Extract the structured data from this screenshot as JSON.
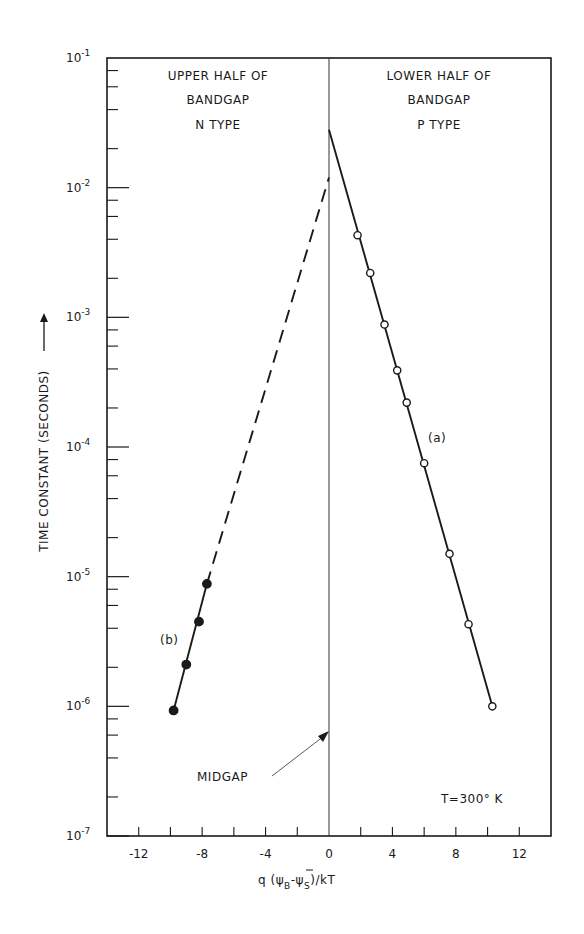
{
  "chart_data": {
    "type": "line",
    "title": "",
    "xlabel": "q (ψB − ψ̄S)/kT",
    "xlabel_parts": {
      "main": "q (ψ",
      "sub1": "B",
      "mid": "-ψ̄",
      "sub2": "S",
      "tail": ")/kT"
    },
    "ylabel": "TIME CONSTANT (SECONDS) ⟶",
    "yscale": "log",
    "xlim": [
      -14,
      14
    ],
    "ylim": [
      1e-07,
      0.1
    ],
    "grid": false,
    "x_ticks": [
      -12,
      -8,
      -4,
      0,
      4,
      8,
      12
    ],
    "x_tick_labels": [
      "-12",
      "-8",
      "-4",
      "0",
      "4",
      "8",
      "12"
    ],
    "y_ticks": [
      0.1,
      0.01,
      0.001,
      0.0001,
      1e-05,
      1e-06,
      1e-07
    ],
    "y_tick_labels": [
      {
        "base": "10",
        "exp": "-1"
      },
      {
        "base": "10",
        "exp": "-2"
      },
      {
        "base": "10",
        "exp": "-3"
      },
      {
        "base": "10",
        "exp": "-4"
      },
      {
        "base": "10",
        "exp": "-5"
      },
      {
        "base": "10",
        "exp": "-6"
      },
      {
        "base": "10",
        "exp": "-7"
      }
    ],
    "series": [
      {
        "name": "(a)",
        "marker": "open-circle",
        "line": "solid",
        "x": [
          1.8,
          2.6,
          3.5,
          4.3,
          4.9,
          6.0,
          7.6,
          8.8,
          10.3
        ],
        "y": [
          0.0043,
          0.0022,
          0.00088,
          0.00039,
          0.00022,
          7.5e-05,
          1.5e-05,
          4.3e-06,
          1e-06
        ],
        "fit_line": {
          "x": [
            0,
            10.3
          ],
          "y": [
            0.028,
            1e-06
          ]
        }
      },
      {
        "name": "(b)",
        "marker": "filled-circle",
        "line": "solid-then-dashed",
        "x": [
          -9.8,
          -9.0,
          -8.2,
          -7.7
        ],
        "y": [
          9.3e-07,
          2.1e-06,
          4.5e-06,
          8.8e-06
        ],
        "fit_line": {
          "x": [
            -9.8,
            -7.7
          ],
          "y": [
            9.3e-07,
            8.8e-06
          ]
        },
        "extrapolation": {
          "x": [
            -7.7,
            0
          ],
          "y": [
            8.8e-06,
            0.012
          ],
          "style": "dashed"
        }
      }
    ],
    "annotations": [
      {
        "text": "UPPER HALF OF",
        "region": "left"
      },
      {
        "text": "BANDGAP",
        "region": "left"
      },
      {
        "text": "N TYPE",
        "region": "left"
      },
      {
        "text": "LOWER HALF OF",
        "region": "right"
      },
      {
        "text": "BANDGAP",
        "region": "right"
      },
      {
        "text": "P TYPE",
        "region": "right"
      },
      {
        "text": "MIDGAP",
        "arrow_to": {
          "x": 0,
          "y": 7e-07
        }
      },
      {
        "text": "T=300° K",
        "position": "lower-right"
      },
      {
        "text": "(a)",
        "series": "a"
      },
      {
        "text": "(b)",
        "series": "b"
      }
    ],
    "vertical_line": {
      "x": 0
    }
  },
  "labels": {
    "upper_left_1": "UPPER HALF OF",
    "upper_left_2": "BANDGAP",
    "upper_left_3": "N TYPE",
    "upper_right_1": "LOWER HALF OF",
    "upper_right_2": "BANDGAP",
    "upper_right_3": "P TYPE",
    "midgap": "MIDGAP",
    "temperature": "T=300° K",
    "series_a": "(a)",
    "series_b": "(b)",
    "ylabel": "TIME CONSTANT (SECONDS)",
    "xlabel_q": "q (",
    "xlabel_psi1": "ψ",
    "xlabel_sub1": "B",
    "xlabel_dash": "-",
    "xlabel_psi2": "ψ",
    "xlabel_sub2": "S",
    "xlabel_tail": ")/kT"
  }
}
